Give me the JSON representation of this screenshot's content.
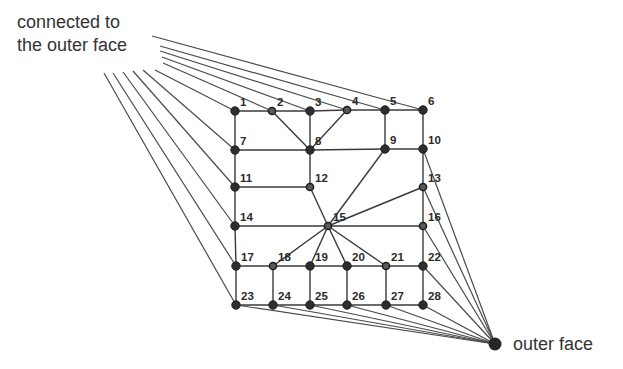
{
  "caption_top": {
    "line1": "connected to",
    "line2": "the outer face"
  },
  "caption_outer": "outer face",
  "colors": {
    "line": "#3a3a3a",
    "node": "#2e2e2e",
    "text": "#333333"
  },
  "outer_face_node": {
    "x": 495,
    "y": 344
  },
  "nodes": [
    {
      "id": 1,
      "x": 235,
      "y": 111,
      "hollow": false
    },
    {
      "id": 2,
      "x": 272,
      "y": 111,
      "hollow": true
    },
    {
      "id": 3,
      "x": 310,
      "y": 111,
      "hollow": false
    },
    {
      "id": 4,
      "x": 347,
      "y": 110,
      "hollow": true
    },
    {
      "id": 5,
      "x": 385,
      "y": 110,
      "hollow": false
    },
    {
      "id": 6,
      "x": 423,
      "y": 110,
      "hollow": false
    },
    {
      "id": 7,
      "x": 235,
      "y": 150,
      "hollow": false
    },
    {
      "id": 8,
      "x": 310,
      "y": 150,
      "hollow": false
    },
    {
      "id": 9,
      "x": 385,
      "y": 149,
      "hollow": false
    },
    {
      "id": 10,
      "x": 423,
      "y": 149,
      "hollow": false
    },
    {
      "id": 11,
      "x": 235,
      "y": 187,
      "hollow": false
    },
    {
      "id": 12,
      "x": 310,
      "y": 187,
      "hollow": true
    },
    {
      "id": 13,
      "x": 423,
      "y": 187,
      "hollow": true
    },
    {
      "id": 14,
      "x": 235,
      "y": 226,
      "hollow": false
    },
    {
      "id": 15,
      "x": 328,
      "y": 226,
      "hollow": true
    },
    {
      "id": 16,
      "x": 423,
      "y": 226,
      "hollow": true
    },
    {
      "id": 17,
      "x": 236,
      "y": 266,
      "hollow": false
    },
    {
      "id": 18,
      "x": 273,
      "y": 266,
      "hollow": true
    },
    {
      "id": 19,
      "x": 310,
      "y": 266,
      "hollow": false
    },
    {
      "id": 20,
      "x": 347,
      "y": 266,
      "hollow": false
    },
    {
      "id": 21,
      "x": 386,
      "y": 266,
      "hollow": true
    },
    {
      "id": 22,
      "x": 423,
      "y": 266,
      "hollow": false
    },
    {
      "id": 23,
      "x": 236,
      "y": 305,
      "hollow": false
    },
    {
      "id": 24,
      "x": 273,
      "y": 305,
      "hollow": false
    },
    {
      "id": 25,
      "x": 310,
      "y": 305,
      "hollow": false
    },
    {
      "id": 26,
      "x": 347,
      "y": 305,
      "hollow": false
    },
    {
      "id": 27,
      "x": 386,
      "y": 305,
      "hollow": false
    },
    {
      "id": 28,
      "x": 423,
      "y": 305,
      "hollow": false
    }
  ],
  "edges": [
    [
      1,
      2
    ],
    [
      2,
      3
    ],
    [
      3,
      4
    ],
    [
      4,
      5
    ],
    [
      5,
      6
    ],
    [
      1,
      7
    ],
    [
      2,
      8
    ],
    [
      3,
      8
    ],
    [
      4,
      8
    ],
    [
      5,
      9
    ],
    [
      6,
      10
    ],
    [
      7,
      8
    ],
    [
      8,
      9
    ],
    [
      9,
      10
    ],
    [
      7,
      11
    ],
    [
      8,
      12
    ],
    [
      11,
      12
    ],
    [
      10,
      13
    ],
    [
      9,
      15
    ],
    [
      11,
      14
    ],
    [
      12,
      15
    ],
    [
      13,
      15
    ],
    [
      14,
      15
    ],
    [
      15,
      16
    ],
    [
      13,
      16
    ],
    [
      14,
      17
    ],
    [
      15,
      18
    ],
    [
      15,
      19
    ],
    [
      15,
      20
    ],
    [
      15,
      21
    ],
    [
      16,
      22
    ],
    [
      17,
      18
    ],
    [
      18,
      19
    ],
    [
      19,
      20
    ],
    [
      20,
      21
    ],
    [
      21,
      22
    ],
    [
      17,
      23
    ],
    [
      18,
      24
    ],
    [
      19,
      25
    ],
    [
      20,
      26
    ],
    [
      21,
      27
    ],
    [
      22,
      28
    ],
    [
      23,
      24
    ],
    [
      24,
      25
    ],
    [
      25,
      26
    ],
    [
      26,
      27
    ],
    [
      27,
      28
    ]
  ],
  "top_outer_connections": [
    {
      "node": 6,
      "from": [
        152,
        36
      ]
    },
    {
      "node": 5,
      "from": [
        160,
        46
      ]
    },
    {
      "node": 4,
      "from": [
        160,
        51
      ]
    },
    {
      "node": 3,
      "from": [
        162,
        57
      ]
    },
    {
      "node": 2,
      "from": [
        163,
        63
      ]
    },
    {
      "node": 1,
      "from": [
        155,
        70
      ]
    },
    {
      "node": 7,
      "from": [
        143,
        70
      ]
    },
    {
      "node": 11,
      "from": [
        133,
        71
      ]
    },
    {
      "node": 14,
      "from": [
        123,
        72
      ]
    },
    {
      "node": 17,
      "from": [
        113,
        73
      ]
    },
    {
      "node": 23,
      "from": [
        104,
        73
      ]
    }
  ],
  "bottom_outer_connections": [
    10,
    13,
    16,
    22,
    28,
    27,
    26,
    25,
    24,
    23
  ]
}
